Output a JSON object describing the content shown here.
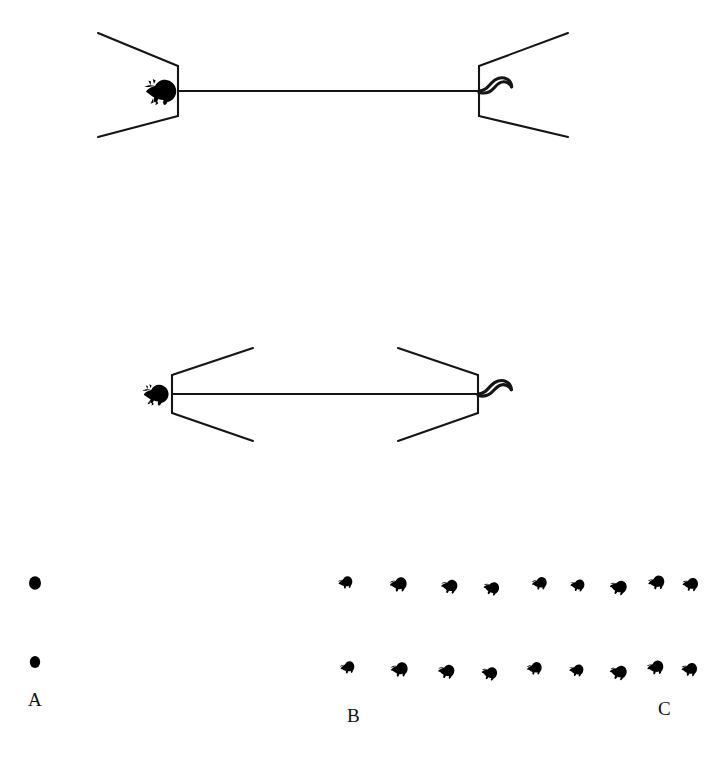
{
  "figure": {
    "background_color": "#ffffff",
    "stroke_color": "#151515",
    "glyph_color": "#000000",
    "width": 712,
    "height": 769,
    "caption_font": "serif"
  },
  "panels": [
    {
      "id": "A",
      "label": "A",
      "label_x": 28,
      "label_y": 706,
      "description": "two isolated solid dots stacked vertically",
      "marks": [
        {
          "name": "dot-upper",
          "cx": 35,
          "cy": 583,
          "rx": 6.0,
          "ry": 6.8
        },
        {
          "name": "dot-lower",
          "cx": 35,
          "cy": 662,
          "rx": 5.2,
          "ry": 6.0
        }
      ]
    },
    {
      "id": "B",
      "label": "B",
      "label_x": 347,
      "label_y": 722
    },
    {
      "id": "C",
      "label": "C",
      "label_x": 658,
      "label_y": 715
    }
  ],
  "diagrams": [
    {
      "name": "top-diagram",
      "orientation": "brackets-pointing-inward",
      "axis_y": 91,
      "axis_x_start": 178,
      "axis_x_end": 479,
      "left_bracket": {
        "vertex_x": 178,
        "top_arm_end_x": 98,
        "top_arm_end_y": 33,
        "bottom_arm_end_x": 98,
        "bottom_arm_end_y": 137,
        "corner_top_y": 66,
        "corner_bottom_y": 116
      },
      "right_bracket": {
        "vertex_x": 479,
        "top_arm_end_x": 568,
        "top_arm_end_y": 33,
        "bottom_arm_end_x": 568,
        "bottom_arm_end_y": 137,
        "corner_top_y": 66,
        "corner_bottom_y": 116
      },
      "left_glyph": "bird-silhouette-left",
      "right_glyph": "s-curve-tail"
    },
    {
      "name": "bottom-diagram",
      "orientation": "brackets-pointing-outward",
      "axis_y": 394,
      "axis_x_start": 172,
      "axis_x_end": 478,
      "left_bracket": {
        "vertex_x": 172,
        "top_arm_end_x": 253,
        "top_arm_end_y": 348,
        "bottom_arm_end_x": 253,
        "bottom_arm_end_y": 441,
        "corner_top_y": 375,
        "corner_bottom_y": 413
      },
      "right_bracket": {
        "vertex_x": 478,
        "top_arm_end_x": 398,
        "top_arm_end_y": 348,
        "bottom_arm_end_x": 398,
        "bottom_arm_end_y": 441,
        "corner_top_y": 375,
        "corner_bottom_y": 413
      },
      "left_glyph": "bird-silhouette-left",
      "right_glyph": "s-curve-tail"
    }
  ],
  "glyph_rows": [
    {
      "name": "glyph-row-upper",
      "y": 585,
      "count": 9,
      "x_positions": [
        346,
        399,
        450,
        492,
        540,
        578,
        619,
        657,
        691
      ]
    },
    {
      "name": "glyph-row-lower",
      "y": 670,
      "count": 9,
      "x_positions": [
        348,
        400,
        447,
        490,
        535,
        577,
        619,
        656,
        690
      ]
    }
  ]
}
